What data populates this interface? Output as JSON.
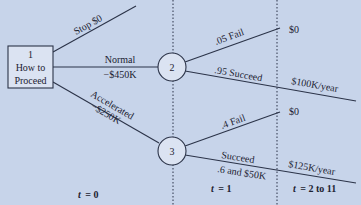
{
  "colors": {
    "background": "#c7d4ea",
    "node_fill": "#dbe3f2",
    "line": "#2b3348",
    "text": "#1c2231"
  },
  "decision_node": {
    "id": "1",
    "line1": "How to",
    "line2": "Proceed"
  },
  "chance_nodes": [
    {
      "id": "2"
    },
    {
      "id": "3"
    }
  ],
  "branches": {
    "stop": {
      "label": "Stop $0"
    },
    "normal": {
      "label": "Normal",
      "cost": "−$450K"
    },
    "accelerated": {
      "label": "Accelerated",
      "cost": "−$250K"
    },
    "node2_fail": {
      "label": ".05 Fail",
      "outcome": "$0"
    },
    "node2_succeed": {
      "label": ".95 Succeed",
      "outcome": "$100K/year"
    },
    "node3_fail": {
      "label": ".4 Fail",
      "outcome": "$0"
    },
    "node3_succeed": {
      "label": "Succeed",
      "sub": ".6 and $50K",
      "outcome": "$125K/year"
    }
  },
  "time_labels": {
    "t0": {
      "var": "t",
      "value": "= 0"
    },
    "t1": {
      "var": "t",
      "value": "= 1"
    },
    "t2": {
      "var": "t",
      "value": "= 2 to 11"
    }
  }
}
